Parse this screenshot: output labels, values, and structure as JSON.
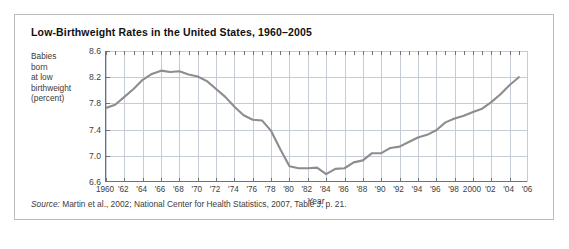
{
  "figure": {
    "title": "Low-Birthweight Rates in the United States, 1960–2005",
    "source_prefix": "Source:",
    "source_text": " Martin et al., 2002; National Center for Health Statistics, 2007, Table J, p. 21.",
    "ylabel_lines": [
      "Babies",
      "born",
      "at low",
      "birthweight",
      "(percent)"
    ],
    "line_color": "#8d8d8d",
    "grid_color": "#c5ccd6",
    "axis_color": "#6e7378",
    "border_color": "#b9bcc0"
  },
  "chart_data": {
    "type": "line",
    "title": "Low-Birthweight Rates in the United States, 1960–2005",
    "xlabel": "Year",
    "ylabel": "Babies born at low birthweight (percent)",
    "xlim": [
      1960,
      2006
    ],
    "ylim": [
      6.6,
      8.6
    ],
    "ytick_values": [
      8.6,
      8.2,
      7.8,
      7.4,
      7.0,
      6.6
    ],
    "ytick_labels": [
      "8.6",
      "8.2",
      "7.8",
      "7.4",
      "7.0",
      "6.6"
    ],
    "xtick_values": [
      1960,
      1962,
      1964,
      1966,
      1968,
      1970,
      1972,
      1974,
      1976,
      1978,
      1980,
      1982,
      1984,
      1986,
      1988,
      1990,
      1992,
      1994,
      1996,
      1998,
      2000,
      2002,
      2004,
      2006
    ],
    "xtick_labels": [
      "1960",
      "'62",
      "'64",
      "'66",
      "'68",
      "'70",
      "'72",
      "'74",
      "'76",
      "'78",
      "'80",
      "'82",
      "'84",
      "'86",
      "'88",
      "'90",
      "'92",
      "'94",
      "'96",
      "'98",
      "2000",
      "'02",
      "'04",
      "'06"
    ],
    "grid": true,
    "legend": "none",
    "x": [
      1960,
      1961,
      1962,
      1963,
      1964,
      1965,
      1966,
      1967,
      1968,
      1969,
      1970,
      1971,
      1972,
      1973,
      1974,
      1975,
      1976,
      1977,
      1978,
      1979,
      1980,
      1981,
      1982,
      1983,
      1984,
      1985,
      1986,
      1987,
      1988,
      1989,
      1990,
      1991,
      1992,
      1993,
      1994,
      1995,
      1996,
      1997,
      1998,
      1999,
      2000,
      2001,
      2002,
      2003,
      2004,
      2005
    ],
    "values": [
      7.73,
      7.78,
      7.9,
      8.02,
      8.16,
      8.25,
      8.3,
      8.28,
      8.29,
      8.24,
      8.21,
      8.14,
      8.02,
      7.9,
      7.75,
      7.62,
      7.55,
      7.54,
      7.38,
      7.1,
      6.84,
      6.81,
      6.81,
      6.82,
      6.72,
      6.8,
      6.81,
      6.9,
      6.93,
      7.04,
      7.04,
      7.12,
      7.14,
      7.21,
      7.28,
      7.32,
      7.39,
      7.51,
      7.57,
      7.61,
      7.67,
      7.72,
      7.82,
      7.94,
      8.08,
      8.2
    ],
    "series_name": "Percent of babies born at low birthweight"
  }
}
